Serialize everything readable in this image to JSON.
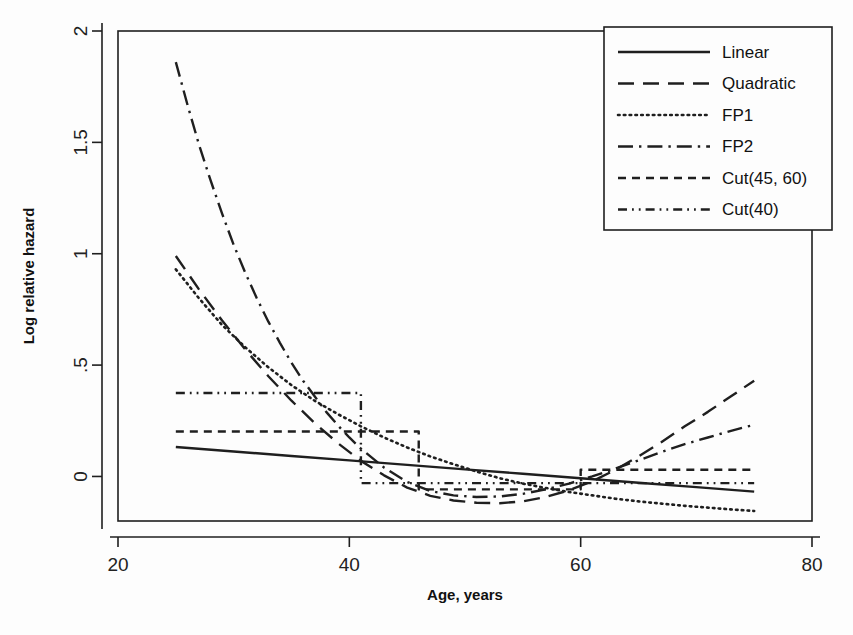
{
  "figure": {
    "background": "#fdfdfd",
    "ink_color": "#1f1f1f",
    "plot_box": {
      "left": 118,
      "right": 812,
      "top": 31,
      "bottom": 521
    }
  },
  "chart_data": {
    "type": "line",
    "title": "",
    "xlabel": "Age, years",
    "ylabel": "Log relative hazard",
    "xlim": [
      20,
      80
    ],
    "ylim": [
      -0.2,
      2.0
    ],
    "xticks": [
      20,
      40,
      60,
      80
    ],
    "xtick_labels": [
      "20",
      "40",
      "60",
      "80"
    ],
    "yticks": [
      0,
      0.5,
      1,
      1.5,
      2
    ],
    "ytick_labels": [
      "0",
      ".5",
      "1",
      "1.5",
      "2"
    ],
    "grid": false,
    "legend_position": "top-right",
    "x_domain_drawn": [
      25,
      75
    ],
    "series": [
      {
        "name": "Linear",
        "style": "solid",
        "x": [
          25,
          30,
          35,
          40,
          45,
          50,
          55,
          60,
          65,
          70,
          75
        ],
        "y": [
          0.132,
          0.112,
          0.092,
          0.072,
          0.052,
          0.032,
          0.012,
          -0.008,
          -0.028,
          -0.048,
          -0.068
        ]
      },
      {
        "name": "Quadratic",
        "style": "dashed",
        "x": [
          25,
          27,
          29,
          31,
          33,
          35,
          37,
          39,
          41,
          43,
          45,
          47,
          49,
          51,
          53,
          55,
          57,
          59,
          61,
          63,
          65,
          67,
          69,
          71,
          73,
          75
        ],
        "y": [
          0.99,
          0.84,
          0.7,
          0.57,
          0.45,
          0.34,
          0.24,
          0.15,
          0.07,
          0.005,
          -0.05,
          -0.087,
          -0.108,
          -0.118,
          -0.12,
          -0.112,
          -0.092,
          -0.062,
          -0.022,
          0.03,
          0.09,
          0.155,
          0.225,
          0.29,
          0.36,
          0.43
        ]
      },
      {
        "name": "FP1",
        "style": "dotted",
        "x": [
          25,
          27,
          29,
          31,
          33,
          35,
          37,
          39,
          41,
          43,
          45,
          47,
          49,
          51,
          53,
          55,
          57,
          59,
          61,
          63,
          65,
          67,
          69,
          71,
          73,
          75
        ],
        "y": [
          0.93,
          0.8,
          0.68,
          0.58,
          0.49,
          0.41,
          0.34,
          0.28,
          0.225,
          0.175,
          0.13,
          0.09,
          0.055,
          0.022,
          -0.008,
          -0.032,
          -0.052,
          -0.07,
          -0.085,
          -0.1,
          -0.112,
          -0.122,
          -0.132,
          -0.14,
          -0.148,
          -0.155
        ]
      },
      {
        "name": "FP2",
        "style": "dashdot",
        "x": [
          25,
          26,
          27,
          28,
          29,
          30,
          31,
          32,
          33,
          34,
          35,
          36,
          37,
          38,
          39,
          40,
          41,
          43,
          45,
          47,
          49,
          51,
          53,
          55,
          57,
          59,
          61,
          63,
          65,
          67,
          69,
          71,
          73,
          75
        ],
        "y": [
          1.86,
          1.67,
          1.49,
          1.33,
          1.18,
          1.04,
          0.915,
          0.8,
          0.695,
          0.6,
          0.51,
          0.43,
          0.36,
          0.29,
          0.23,
          0.175,
          0.125,
          0.04,
          -0.025,
          -0.065,
          -0.085,
          -0.092,
          -0.09,
          -0.078,
          -0.058,
          -0.032,
          0.0,
          0.035,
          0.072,
          0.11,
          0.145,
          0.175,
          0.205,
          0.232
        ]
      },
      {
        "name": "Cut(45, 60)",
        "style": "shortdash",
        "step": true,
        "breakpoints": [
          46,
          60
        ],
        "x": [
          25,
          46,
          46,
          60,
          60,
          75
        ],
        "y": [
          0.202,
          0.202,
          -0.058,
          -0.058,
          0.03,
          0.03
        ]
      },
      {
        "name": "Cut(40)",
        "style": "dashdotdot",
        "step": true,
        "breakpoints": [
          41
        ],
        "x": [
          25,
          41,
          41,
          75
        ],
        "y": [
          0.375,
          0.375,
          -0.03,
          -0.03
        ]
      }
    ]
  },
  "legend": {
    "items": [
      {
        "label": "Linear",
        "style": "solid"
      },
      {
        "label": "Quadratic",
        "style": "dashed"
      },
      {
        "label": "FP1",
        "style": "dotted"
      },
      {
        "label": "FP2",
        "style": "dashdot"
      },
      {
        "label": "Cut(45, 60)",
        "style": "shortdash"
      },
      {
        "label": "Cut(40)",
        "style": "dashdotdot"
      }
    ]
  }
}
